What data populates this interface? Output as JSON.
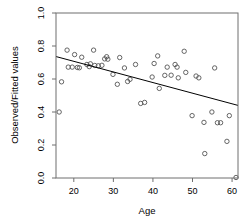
{
  "chart_data": {
    "type": "scatter",
    "title": "",
    "xlabel": "Age",
    "ylabel": "Observed/Fitted values",
    "xlim": [
      15.5,
      61.5
    ],
    "ylim": [
      0.0,
      1.0
    ],
    "xticks": [
      20,
      30,
      40,
      50,
      60
    ],
    "xticklabels": [
      "20",
      "30",
      "40",
      "50",
      "60"
    ],
    "yticks": [
      0.0,
      0.2,
      0.4,
      0.6,
      0.8,
      1.0
    ],
    "yticklabels": [
      "0.0",
      "0.2",
      "0.4",
      "0.6",
      "0.8",
      "1.0"
    ],
    "grid": false,
    "legend": null,
    "marker": "open-circle",
    "marker_color": "#555555",
    "points": [
      {
        "x": 16.3,
        "y": 0.4
      },
      {
        "x": 16.9,
        "y": 0.583
      },
      {
        "x": 18.3,
        "y": 0.775
      },
      {
        "x": 18.6,
        "y": 0.672
      },
      {
        "x": 19.6,
        "y": 0.672
      },
      {
        "x": 20.2,
        "y": 0.748
      },
      {
        "x": 20.9,
        "y": 0.67
      },
      {
        "x": 21.4,
        "y": 0.668
      },
      {
        "x": 22.0,
        "y": 0.732
      },
      {
        "x": 23.3,
        "y": 0.688
      },
      {
        "x": 23.9,
        "y": 0.675
      },
      {
        "x": 24.2,
        "y": 0.692
      },
      {
        "x": 25.0,
        "y": 0.775
      },
      {
        "x": 25.3,
        "y": 0.682
      },
      {
        "x": 26.2,
        "y": 0.68
      },
      {
        "x": 27.1,
        "y": 0.683
      },
      {
        "x": 27.8,
        "y": 0.722
      },
      {
        "x": 28.3,
        "y": 0.735
      },
      {
        "x": 28.6,
        "y": 0.72
      },
      {
        "x": 29.9,
        "y": 0.628
      },
      {
        "x": 31.0,
        "y": 0.568
      },
      {
        "x": 31.6,
        "y": 0.73
      },
      {
        "x": 32.8,
        "y": 0.667
      },
      {
        "x": 33.6,
        "y": 0.585
      },
      {
        "x": 34.2,
        "y": 0.598
      },
      {
        "x": 35.6,
        "y": 0.688
      },
      {
        "x": 36.9,
        "y": 0.452
      },
      {
        "x": 37.9,
        "y": 0.458
      },
      {
        "x": 39.8,
        "y": 0.612
      },
      {
        "x": 40.3,
        "y": 0.694
      },
      {
        "x": 41.2,
        "y": 0.74
      },
      {
        "x": 41.6,
        "y": 0.543
      },
      {
        "x": 43.0,
        "y": 0.622
      },
      {
        "x": 43.6,
        "y": 0.672
      },
      {
        "x": 44.6,
        "y": 0.623
      },
      {
        "x": 45.6,
        "y": 0.688
      },
      {
        "x": 46.1,
        "y": 0.672
      },
      {
        "x": 46.4,
        "y": 0.607
      },
      {
        "x": 47.9,
        "y": 0.768
      },
      {
        "x": 48.3,
        "y": 0.64
      },
      {
        "x": 49.9,
        "y": 0.378
      },
      {
        "x": 50.9,
        "y": 0.618
      },
      {
        "x": 51.6,
        "y": 0.607
      },
      {
        "x": 52.9,
        "y": 0.337
      },
      {
        "x": 53.1,
        "y": 0.148
      },
      {
        "x": 54.9,
        "y": 0.4
      },
      {
        "x": 55.6,
        "y": 0.667
      },
      {
        "x": 56.3,
        "y": 0.335
      },
      {
        "x": 57.1,
        "y": 0.335
      },
      {
        "x": 58.7,
        "y": 0.222
      },
      {
        "x": 59.3,
        "y": 0.378
      },
      {
        "x": 61.0,
        "y": 0.003
      }
    ],
    "fit_line": {
      "name": "fitted-trend-line",
      "x_start": 15.5,
      "y_start": 0.736,
      "x_end": 61.5,
      "y_end": 0.44,
      "color": "#000000"
    }
  }
}
